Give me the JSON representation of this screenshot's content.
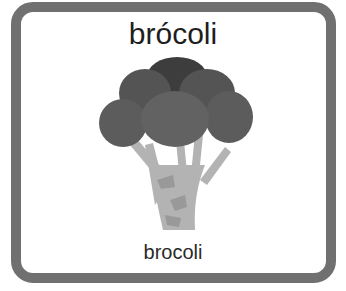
{
  "card": {
    "title": "brócoli",
    "subtitle": "brocoli",
    "illustration": "broccoli-icon",
    "border_color": "#707070"
  }
}
